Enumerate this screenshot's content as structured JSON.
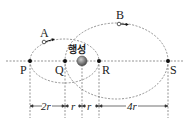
{
  "diagram": {
    "center_label": "행성",
    "points": {
      "P": "P",
      "Q": "Q",
      "R": "R",
      "S": "S"
    },
    "satellites": {
      "A": "A",
      "B": "B"
    },
    "dimensions": [
      {
        "label": "2r",
        "from": "P",
        "to": "Q"
      },
      {
        "label": "r",
        "from": "Q",
        "to": "planet"
      },
      {
        "label": "r",
        "from": "planet",
        "to": "R"
      },
      {
        "label": "4r",
        "from": "R",
        "to": "S"
      }
    ],
    "colors": {
      "line": "#555555",
      "planet": "#666666",
      "point": "#111111"
    }
  }
}
